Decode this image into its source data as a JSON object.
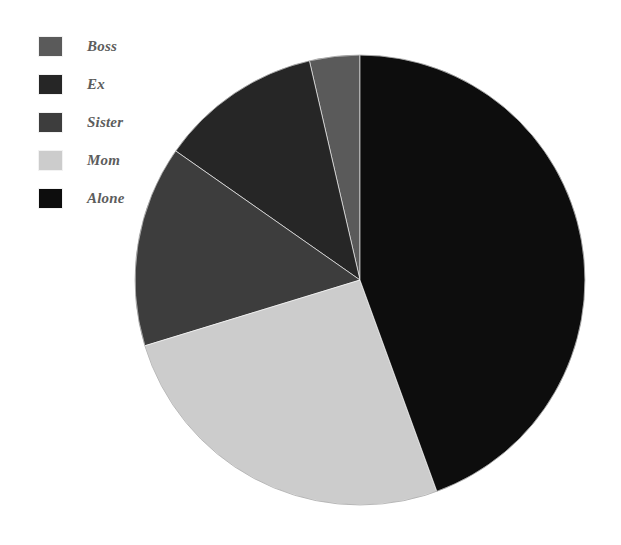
{
  "chart_data": {
    "type": "pie",
    "title": "",
    "subtitle": "",
    "xlabel": "",
    "ylabel": "",
    "grid": false,
    "legend_position": "top-left",
    "start_angle_deg": 0,
    "direction": "clockwise",
    "categories": [
      "Boss",
      "Ex",
      "Sister",
      "Mom",
      "Alone"
    ],
    "values": [
      3.6,
      11.7,
      14.4,
      25.8,
      44.5
    ],
    "unit": "percent",
    "slices": [
      {
        "label": "Boss",
        "value": 3.6,
        "angle_deg": 13,
        "color": "#5a5a5a",
        "start_deg": 347,
        "end_deg": 360
      },
      {
        "label": "Ex",
        "value": 11.7,
        "angle_deg": 42,
        "color": "#262626",
        "start_deg": 305,
        "end_deg": 347
      },
      {
        "label": "Sister",
        "value": 14.4,
        "angle_deg": 52,
        "color": "#3d3d3d",
        "start_deg": 253,
        "end_deg": 305
      },
      {
        "label": "Mom",
        "value": 25.8,
        "angle_deg": 93,
        "color": "#cccccc",
        "start_deg": 160,
        "end_deg": 253
      },
      {
        "label": "Alone",
        "value": 44.5,
        "angle_deg": 160,
        "color": "#0d0d0d",
        "start_deg": 0,
        "end_deg": 160
      }
    ],
    "geometry": {
      "center_x": 360,
      "center_y": 280,
      "radius": 225
    }
  },
  "legend": {
    "items": [
      {
        "label": "Boss",
        "color": "#5a5a5a"
      },
      {
        "label": "Ex",
        "color": "#262626"
      },
      {
        "label": "Sister",
        "color": "#3d3d3d"
      },
      {
        "label": "Mom",
        "color": "#cccccc"
      },
      {
        "label": "Alone",
        "color": "#0d0d0d"
      }
    ]
  },
  "colors": {
    "background": "#ffffff",
    "legend_text": "#5d5d5d",
    "slice_border": "#ffffff",
    "pie_outline": "#8a8a8a"
  }
}
